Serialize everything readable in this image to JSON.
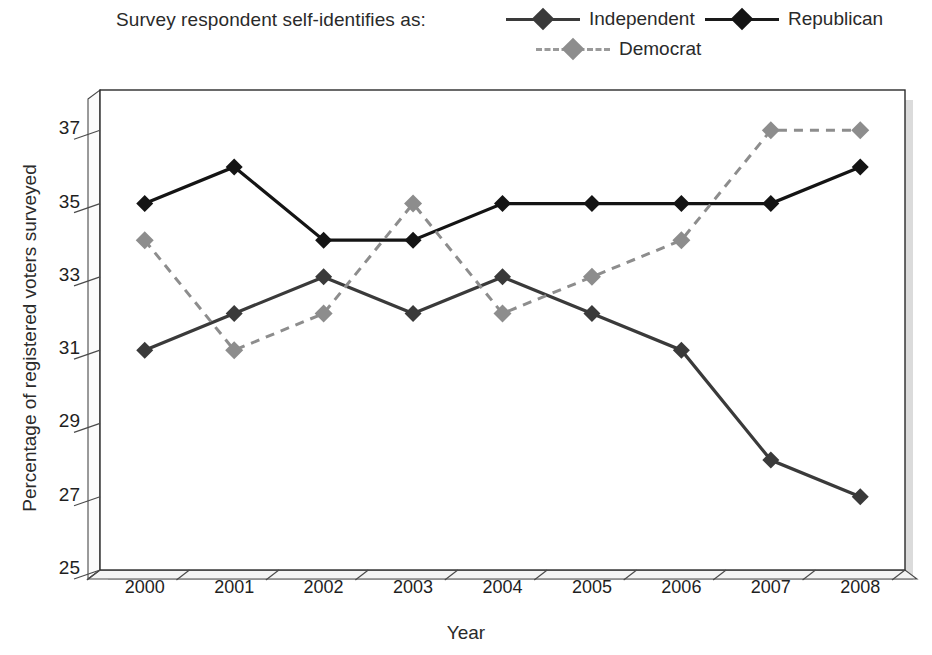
{
  "legend": {
    "title": "Survey respondent self-identifies as:",
    "entries": [
      {
        "label": "Independent",
        "color": "#3a3a3a",
        "style": "solid"
      },
      {
        "label": "Republican",
        "color": "#141414",
        "style": "solid"
      },
      {
        "label": "Democrat",
        "color": "#8d8d8d",
        "style": "dashed"
      }
    ]
  },
  "chart_data": {
    "type": "line",
    "title": "",
    "xlabel": "Year",
    "ylabel": "Percentage of registered voters surveyed",
    "categories": [
      "2000",
      "2001",
      "2002",
      "2003",
      "2004",
      "2005",
      "2006",
      "2007",
      "2008"
    ],
    "yticks": [
      25,
      27,
      29,
      31,
      33,
      35,
      37
    ],
    "ylim": [
      25,
      38
    ],
    "grid": false,
    "legend_position": "top",
    "series": [
      {
        "name": "Independent",
        "color": "#3a3a3a",
        "style": "solid",
        "values": [
          31,
          32,
          33,
          32,
          33,
          32,
          31,
          28,
          27
        ]
      },
      {
        "name": "Republican",
        "color": "#141414",
        "style": "solid",
        "values": [
          35,
          36,
          34,
          34,
          35,
          35,
          35,
          35,
          36
        ]
      },
      {
        "name": "Democrat",
        "color": "#8d8d8d",
        "style": "dashed",
        "values": [
          34,
          31,
          32,
          35,
          32,
          33,
          34,
          37,
          37
        ]
      }
    ]
  }
}
